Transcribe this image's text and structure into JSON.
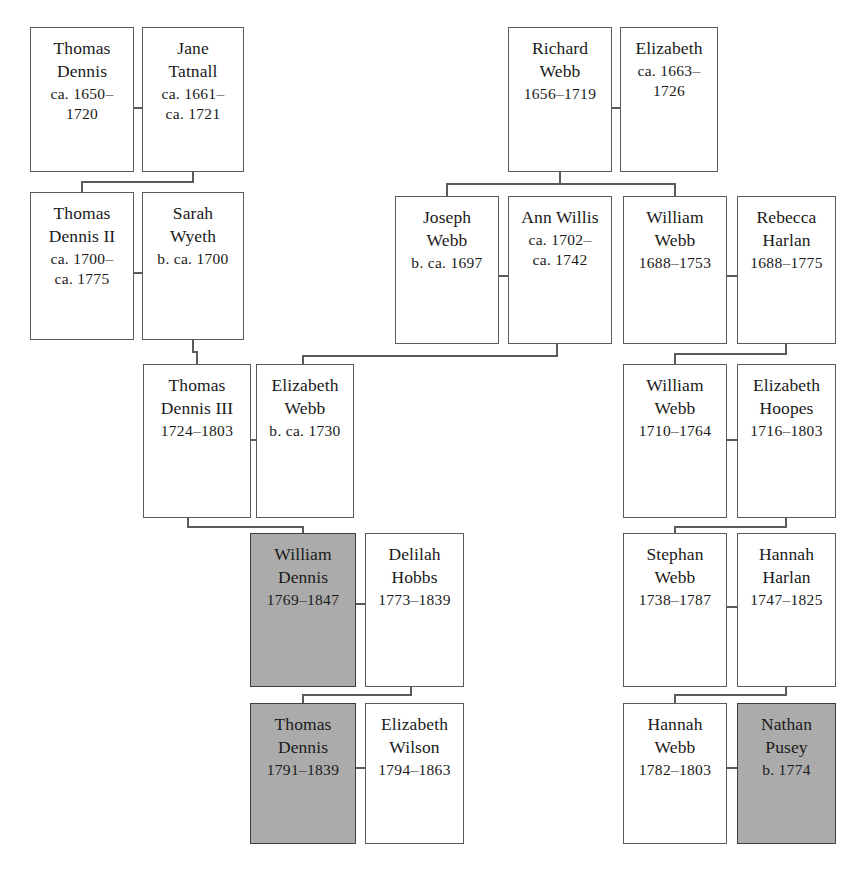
{
  "document": {
    "title": "Dennis–Webb Family Tree",
    "type": "genealogy-chart",
    "generations": 6,
    "highlight_color": "#ababab",
    "background_color": "#ffffff",
    "line_color": "#5b5b5b"
  },
  "legend": {
    "shaded_meaning": "direct ancestral line"
  },
  "people": [
    {
      "id": "thomas-dennis",
      "name_lines": [
        "Thomas",
        "Dennis"
      ],
      "date_lines": [
        "ca. 1650–",
        "1720"
      ],
      "shaded": false,
      "x": 30,
      "y": 27,
      "w": 104,
      "h": 145
    },
    {
      "id": "jane-tatnall",
      "name_lines": [
        "Jane",
        "Tatnall"
      ],
      "date_lines": [
        "ca. 1661–",
        "ca. 1721"
      ],
      "shaded": false,
      "x": 142,
      "y": 27,
      "w": 102,
      "h": 145
    },
    {
      "id": "thomas-dennis-ii",
      "name_lines": [
        "Thomas",
        "Dennis II"
      ],
      "date_lines": [
        "ca. 1700–",
        "ca. 1775"
      ],
      "shaded": false,
      "x": 30,
      "y": 192,
      "w": 104,
      "h": 148
    },
    {
      "id": "sarah-wyeth",
      "name_lines": [
        "Sarah",
        "Wyeth"
      ],
      "date_lines": [
        "b. ca. 1700"
      ],
      "shaded": false,
      "x": 142,
      "y": 192,
      "w": 102,
      "h": 148
    },
    {
      "id": "thomas-dennis-iii",
      "name_lines": [
        "Thomas",
        "Dennis III"
      ],
      "date_lines": [
        "1724–1803"
      ],
      "shaded": false,
      "x": 143,
      "y": 364,
      "w": 108,
      "h": 154
    },
    {
      "id": "elizabeth-webb",
      "name_lines": [
        "Elizabeth",
        "Webb"
      ],
      "date_lines": [
        "b. ca. 1730"
      ],
      "shaded": false,
      "x": 256,
      "y": 364,
      "w": 98,
      "h": 154
    },
    {
      "id": "william-dennis",
      "name_lines": [
        "William",
        "Dennis"
      ],
      "date_lines": [
        "1769–1847"
      ],
      "shaded": true,
      "x": 250,
      "y": 533,
      "w": 106,
      "h": 154
    },
    {
      "id": "delilah-hobbs",
      "name_lines": [
        "Delilah",
        "Hobbs"
      ],
      "date_lines": [
        "1773–1839"
      ],
      "shaded": false,
      "x": 365,
      "y": 533,
      "w": 99,
      "h": 154
    },
    {
      "id": "thomas-dennis-jr",
      "name_lines": [
        "Thomas",
        "Dennis"
      ],
      "date_lines": [
        "1791–1839"
      ],
      "shaded": true,
      "x": 250,
      "y": 703,
      "w": 106,
      "h": 141
    },
    {
      "id": "elizabeth-wilson",
      "name_lines": [
        "Elizabeth",
        "Wilson"
      ],
      "date_lines": [
        "1794–1863"
      ],
      "shaded": false,
      "x": 365,
      "y": 703,
      "w": 99,
      "h": 141
    },
    {
      "id": "richard-webb",
      "name_lines": [
        "Richard",
        "Webb"
      ],
      "date_lines": [
        "1656–1719"
      ],
      "shaded": false,
      "x": 508,
      "y": 27,
      "w": 104,
      "h": 145
    },
    {
      "id": "elizabeth",
      "name_lines": [
        "Elizabeth"
      ],
      "date_lines": [
        "ca. 1663–",
        "1726"
      ],
      "shaded": false,
      "x": 620,
      "y": 27,
      "w": 98,
      "h": 145
    },
    {
      "id": "joseph-webb",
      "name_lines": [
        "Joseph",
        "Webb"
      ],
      "date_lines": [
        "b. ca. 1697"
      ],
      "shaded": false,
      "x": 395,
      "y": 196,
      "w": 104,
      "h": 148
    },
    {
      "id": "ann-willis",
      "name_lines": [
        "Ann Willis"
      ],
      "date_lines": [
        "ca. 1702–",
        "ca. 1742"
      ],
      "shaded": false,
      "x": 508,
      "y": 196,
      "w": 104,
      "h": 148
    },
    {
      "id": "william-webb-1688",
      "name_lines": [
        "William",
        "Webb"
      ],
      "date_lines": [
        "1688–1753"
      ],
      "shaded": false,
      "x": 623,
      "y": 196,
      "w": 104,
      "h": 148
    },
    {
      "id": "rebecca-harlan",
      "name_lines": [
        "Rebecca",
        "Harlan"
      ],
      "date_lines": [
        "1688–1775"
      ],
      "shaded": false,
      "x": 737,
      "y": 196,
      "w": 99,
      "h": 148
    },
    {
      "id": "william-webb-1710",
      "name_lines": [
        "William",
        "Webb"
      ],
      "date_lines": [
        "1710–1764"
      ],
      "shaded": false,
      "x": 623,
      "y": 364,
      "w": 104,
      "h": 154
    },
    {
      "id": "elizabeth-hoopes",
      "name_lines": [
        "Elizabeth",
        "Hoopes"
      ],
      "date_lines": [
        "1716–1803"
      ],
      "shaded": false,
      "x": 737,
      "y": 364,
      "w": 99,
      "h": 154
    },
    {
      "id": "stephan-webb",
      "name_lines": [
        "Stephan",
        "Webb"
      ],
      "date_lines": [
        "1738–1787"
      ],
      "shaded": false,
      "x": 623,
      "y": 533,
      "w": 104,
      "h": 154
    },
    {
      "id": "hannah-harlan",
      "name_lines": [
        "Hannah",
        "Harlan"
      ],
      "date_lines": [
        "1747–1825"
      ],
      "shaded": false,
      "x": 737,
      "y": 533,
      "w": 99,
      "h": 154
    },
    {
      "id": "hannah-webb",
      "name_lines": [
        "Hannah",
        "Webb"
      ],
      "date_lines": [
        "1782–1803"
      ],
      "shaded": false,
      "x": 623,
      "y": 703,
      "w": 104,
      "h": 141
    },
    {
      "id": "nathan-pusey",
      "name_lines": [
        "Nathan",
        "Pusey"
      ],
      "date_lines": [
        "b. 1774"
      ],
      "shaded": true,
      "x": 737,
      "y": 703,
      "w": 99,
      "h": 141
    }
  ],
  "marriage_links": [
    {
      "id": "m-thomas-jane",
      "x1": 134,
      "x2": 142,
      "y": 108
    },
    {
      "id": "m-thomasii-sarah",
      "x1": 134,
      "x2": 142,
      "y": 273
    },
    {
      "id": "m-thomasiii-elizw",
      "x1": 251,
      "x2": 256,
      "y": 440
    },
    {
      "id": "m-william-delilah",
      "x1": 356,
      "x2": 365,
      "y": 604
    },
    {
      "id": "m-thomasjr-elizwil",
      "x1": 356,
      "x2": 365,
      "y": 768
    },
    {
      "id": "m-richard-eliz",
      "x1": 612,
      "x2": 620,
      "y": 108
    },
    {
      "id": "m-joseph-ann",
      "x1": 499,
      "x2": 508,
      "y": 276
    },
    {
      "id": "m-williamw-rebecca",
      "x1": 727,
      "x2": 737,
      "y": 276
    },
    {
      "id": "m-williamw1710-hoopes",
      "x1": 727,
      "x2": 737,
      "y": 440
    },
    {
      "id": "m-stephan-hannahh",
      "x1": 727,
      "x2": 737,
      "y": 607
    },
    {
      "id": "m-hannahw-nathan",
      "x1": 727,
      "x2": 737,
      "y": 768
    }
  ],
  "descent_links": [
    {
      "id": "d-to-thomasii",
      "from_x": 193,
      "from_y": 172,
      "mid_y": 182,
      "to_x": 82,
      "to_y": 192
    },
    {
      "id": "d-to-thomasiii",
      "from_x": 193,
      "from_y": 340,
      "mid_y": 352,
      "to_x": 197,
      "to_y": 364
    },
    {
      "id": "d-to-william",
      "from_x": 188,
      "from_y": 518,
      "mid_y": 527,
      "to_x": 303,
      "to_y": 533
    },
    {
      "id": "d-to-thomasjr",
      "from_x": 411,
      "from_y": 687,
      "mid_y": 695,
      "to_x": 303,
      "to_y": 703
    },
    {
      "id": "d-to-joseph",
      "from_x": 560,
      "from_y": 172,
      "mid_y": 184,
      "to_x": 447,
      "to_y": 196
    },
    {
      "id": "d-to-williamw1688",
      "from_x": 560,
      "from_y": 172,
      "mid_y": 184,
      "to_x": 675,
      "to_y": 196
    },
    {
      "id": "d-to-elizabeth-webb",
      "from_x": 557,
      "from_y": 344,
      "mid_y": 356,
      "to_x": 303,
      "to_y": 364
    },
    {
      "id": "d-to-williamw1710",
      "from_x": 786,
      "from_y": 344,
      "mid_y": 354,
      "to_x": 675,
      "to_y": 364
    },
    {
      "id": "d-to-stephan",
      "from_x": 786,
      "from_y": 518,
      "mid_y": 527,
      "to_x": 675,
      "to_y": 533
    },
    {
      "id": "d-to-hannahwebb",
      "from_x": 786,
      "from_y": 687,
      "mid_y": 695,
      "to_x": 675,
      "to_y": 703
    }
  ]
}
